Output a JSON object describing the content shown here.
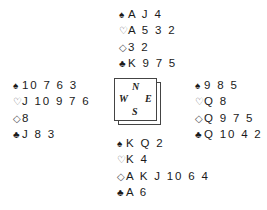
{
  "deal": {
    "north": {
      "spades": {
        "symbol": "♠",
        "cards": "A J 4"
      },
      "hearts": {
        "symbol": "♡",
        "cards": "A 5 3 2"
      },
      "diamonds": {
        "symbol": "◇",
        "cards": "3 2"
      },
      "clubs": {
        "symbol": "♣",
        "cards": "K 9 7 5"
      }
    },
    "west": {
      "spades": {
        "symbol": "♠",
        "cards": "10 7 6 3"
      },
      "hearts": {
        "symbol": "♡",
        "cards": "J 10 9 7 6"
      },
      "diamonds": {
        "symbol": "◇",
        "cards": "8"
      },
      "clubs": {
        "symbol": "♣",
        "cards": "J 8 3"
      }
    },
    "east": {
      "spades": {
        "symbol": "♠",
        "cards": "9 8 5"
      },
      "hearts": {
        "symbol": "♡",
        "cards": "Q 8"
      },
      "diamonds": {
        "symbol": "◇",
        "cards": "Q 9 7 5"
      },
      "clubs": {
        "symbol": "♣",
        "cards": "Q 10 4 2"
      }
    },
    "south": {
      "spades": {
        "symbol": "♠",
        "cards": "K Q 2"
      },
      "hearts": {
        "symbol": "♡",
        "cards": "K 4"
      },
      "diamonds": {
        "symbol": "◇",
        "cards": "A K J 10 6 4"
      },
      "clubs": {
        "symbol": "♣",
        "cards": "A 6"
      }
    }
  },
  "compass": {
    "north": "N",
    "west": "W",
    "east": "E",
    "south": "S"
  }
}
